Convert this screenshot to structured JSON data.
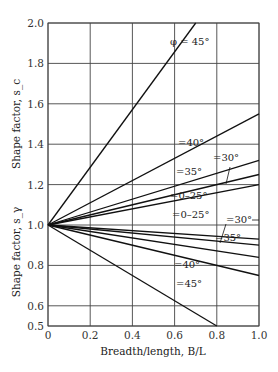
{
  "chart_data": {
    "type": "line",
    "title": "",
    "xlabel": "Breadth/length, B/L",
    "ylabel_upper": "Shape factor, s_c",
    "ylabel_lower": "Shape factor, s_γ",
    "xlim": [
      0,
      1.0
    ],
    "ylim": [
      0.5,
      2.0
    ],
    "x_ticks": [
      "0",
      "0.2",
      "0.4",
      "0.6",
      "0.8",
      "1.0"
    ],
    "y_ticks": [
      "0.5",
      "0.6",
      "0.8",
      "1.0",
      "1.2",
      "1.4",
      "1.6",
      "1.8",
      "2.0"
    ],
    "grid": true,
    "series": [
      {
        "name": "s_c, φ = 45°",
        "x": [
          0,
          0.7
        ],
        "values": [
          1.0,
          2.0
        ],
        "label": "φ = 45°"
      },
      {
        "name": "s_c, φ = 40°",
        "x": [
          0,
          1.0
        ],
        "values": [
          1.0,
          1.55
        ],
        "label": "=40°"
      },
      {
        "name": "s_c, φ = 35°",
        "x": [
          0,
          1.0
        ],
        "values": [
          1.0,
          1.32
        ],
        "label": "=35°"
      },
      {
        "name": "s_c, φ = 30°",
        "x": [
          0,
          1.0
        ],
        "values": [
          1.0,
          1.25
        ],
        "label": "=30°"
      },
      {
        "name": "s_c, φ = 0–25°",
        "x": [
          0,
          1.0
        ],
        "values": [
          1.0,
          1.2
        ],
        "label": "=0–25°"
      },
      {
        "name": "s_γ, φ = 0–25°",
        "x": [
          0,
          1.0
        ],
        "values": [
          1.0,
          0.93
        ],
        "label": "=0–25°"
      },
      {
        "name": "s_γ, φ = 30°",
        "x": [
          0,
          1.0
        ],
        "values": [
          1.0,
          0.9
        ],
        "label": "=30°"
      },
      {
        "name": "s_γ, φ = 35°",
        "x": [
          0,
          1.0
        ],
        "values": [
          1.0,
          0.84
        ],
        "label": "=35°"
      },
      {
        "name": "s_γ, φ = 40°",
        "x": [
          0,
          1.0
        ],
        "values": [
          1.0,
          0.75
        ],
        "label": "=40°"
      },
      {
        "name": "s_γ, φ = 45°",
        "x": [
          0,
          0.8
        ],
        "values": [
          1.0,
          0.5
        ],
        "label": "=45°"
      }
    ]
  }
}
